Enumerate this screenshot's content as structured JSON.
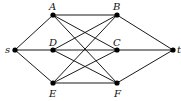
{
  "diagram": {
    "type": "graph",
    "nodes": [
      {
        "id": "s",
        "label": "s",
        "x": 15,
        "y": 50,
        "lx": 5,
        "ly": 53
      },
      {
        "id": "A",
        "label": "A",
        "x": 53,
        "y": 15,
        "lx": 49,
        "ly": 10
      },
      {
        "id": "D",
        "label": "D",
        "x": 53,
        "y": 50,
        "lx": 49,
        "ly": 46
      },
      {
        "id": "E",
        "label": "E",
        "x": 53,
        "y": 83,
        "lx": 49,
        "ly": 97
      },
      {
        "id": "B",
        "label": "B",
        "x": 117,
        "y": 15,
        "lx": 113,
        "ly": 10
      },
      {
        "id": "C",
        "label": "C",
        "x": 117,
        "y": 50,
        "lx": 113,
        "ly": 46
      },
      {
        "id": "F",
        "label": "F",
        "x": 117,
        "y": 83,
        "lx": 114,
        "ly": 97
      },
      {
        "id": "t",
        "label": "t",
        "x": 173,
        "y": 50,
        "lx": 177,
        "ly": 53
      }
    ],
    "edges": [
      [
        "s",
        "A"
      ],
      [
        "s",
        "D"
      ],
      [
        "s",
        "E"
      ],
      [
        "A",
        "B"
      ],
      [
        "A",
        "C"
      ],
      [
        "A",
        "F"
      ],
      [
        "D",
        "B"
      ],
      [
        "D",
        "C"
      ],
      [
        "D",
        "F"
      ],
      [
        "E",
        "B"
      ],
      [
        "E",
        "C"
      ],
      [
        "E",
        "F"
      ],
      [
        "B",
        "t"
      ],
      [
        "C",
        "t"
      ],
      [
        "F",
        "t"
      ]
    ]
  }
}
